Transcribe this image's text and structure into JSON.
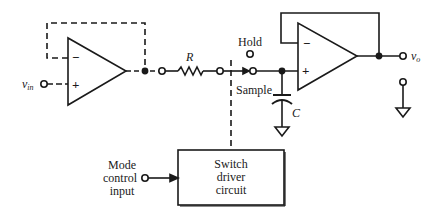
{
  "diagram": {
    "type": "circuit-schematic",
    "colors": {
      "stroke": "#1a1a1a",
      "background": "#ffffff"
    },
    "labels": {
      "vin": "v",
      "vin_sub": "in",
      "vo": "v",
      "vo_sub": "o",
      "resistor": "R",
      "capacitor": "C",
      "hold": "Hold",
      "sample": "Sample",
      "opamp1_minus": "−",
      "opamp1_plus": "+",
      "opamp2_minus": "−",
      "opamp2_plus": "+",
      "mode_line1": "Mode",
      "mode_line2": "control",
      "mode_line3": "input",
      "driver_line1": "Switch",
      "driver_line2": "driver",
      "driver_line3": "circuit"
    },
    "components": [
      {
        "id": "opamp-1",
        "kind": "op-amp",
        "role": "input buffer",
        "feedback": "dashed (optional) output-to-inverting"
      },
      {
        "id": "resistor-R",
        "kind": "resistor",
        "label": "R"
      },
      {
        "id": "switch",
        "kind": "SPDT switch",
        "positions": [
          "Hold",
          "Sample"
        ],
        "current_position": "Sample"
      },
      {
        "id": "capacitor-C",
        "kind": "capacitor",
        "label": "C",
        "connected_to": "ground"
      },
      {
        "id": "opamp-2",
        "kind": "op-amp",
        "role": "voltage follower output buffer"
      },
      {
        "id": "switch-driver",
        "kind": "block",
        "label": "Switch driver circuit"
      },
      {
        "id": "mode-control",
        "kind": "input terminal",
        "label": "Mode control input"
      }
    ]
  }
}
